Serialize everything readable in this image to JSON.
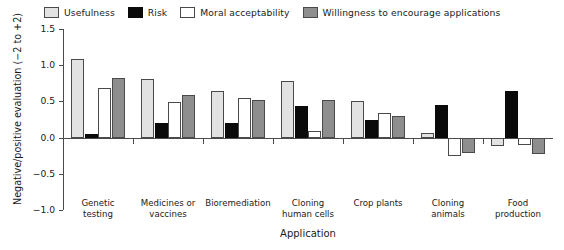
{
  "chart_data": {
    "type": "bar",
    "title": "",
    "xlabel": "Application",
    "ylabel": "Negative/positive evaluation (−2 to +2)",
    "ylim": [
      -1.0,
      1.5
    ],
    "yticks": [
      "1.5",
      "1.0",
      "0.5",
      "0.0",
      "−0.5",
      "−1.0"
    ],
    "ytick_values": [
      1.5,
      1.0,
      0.5,
      0.0,
      -0.5,
      -1.0
    ],
    "grid": false,
    "legend_position": "top",
    "categories": [
      "Genetic testing",
      "Medicines or vaccines",
      "Bioremediation",
      "Cloning human cells",
      "Crop plants",
      "Cloning animals",
      "Food production"
    ],
    "category_lines": [
      [
        "Genetic",
        "testing"
      ],
      [
        "Medicines or",
        "vaccines"
      ],
      [
        "Bioremediation",
        ""
      ],
      [
        "Cloning",
        "human cells"
      ],
      [
        "Crop plants",
        ""
      ],
      [
        "Cloning",
        "animals"
      ],
      [
        "Food",
        "production"
      ]
    ],
    "series": [
      {
        "name": "Usefulness",
        "color": "#e2e2e2",
        "border": "#4a4a4a",
        "values": [
          1.08,
          0.81,
          0.65,
          0.78,
          0.5,
          0.06,
          -0.12
        ]
      },
      {
        "name": "Risk",
        "color": "#0a0a0a",
        "border": "#0a0a0a",
        "values": [
          0.05,
          0.2,
          0.2,
          0.44,
          0.24,
          0.45,
          0.65
        ]
      },
      {
        "name": "Moral acceptability",
        "color": "#ffffff",
        "border": "#4a4a4a",
        "values": [
          0.68,
          0.49,
          0.55,
          0.09,
          0.34,
          -0.26,
          -0.1
        ]
      },
      {
        "name": "Willingness to encourage applications",
        "color": "#8e8e8e",
        "border": "#4a4a4a",
        "values": [
          0.83,
          0.59,
          0.52,
          0.52,
          0.3,
          -0.21,
          -0.22
        ]
      }
    ]
  }
}
